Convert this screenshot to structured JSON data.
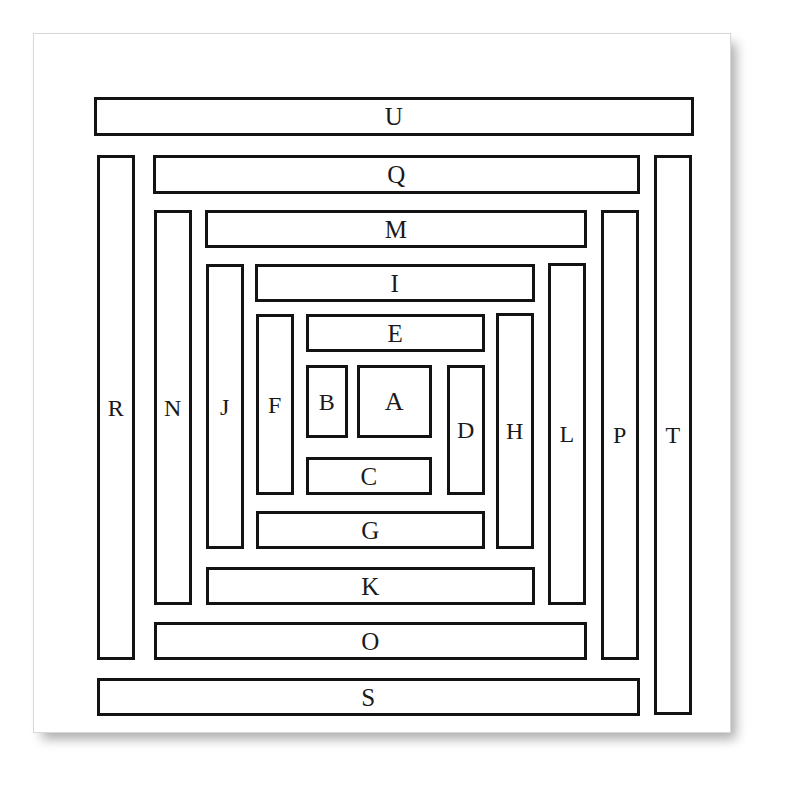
{
  "figure": {
    "background_color": "#ffffff",
    "paper_color": "#ffffff",
    "stroke_color": "#131313",
    "label_color": "#1a1a1a",
    "stroke_width_px": 3,
    "paper": {
      "x": 33,
      "y": 33,
      "w": 698,
      "h": 700
    },
    "labels_in_spiral_order": [
      "A",
      "B",
      "C",
      "D",
      "E",
      "F",
      "G",
      "H",
      "I",
      "J",
      "K",
      "L",
      "M",
      "N",
      "O",
      "P",
      "Q",
      "R",
      "S",
      "T",
      "U"
    ],
    "rect_count": 21
  },
  "chart_data": {
    "type": "table",
    "xlabel": "",
    "ylabel": "",
    "columns": [
      "label",
      "x",
      "y",
      "w",
      "h",
      "orientation"
    ],
    "rects": [
      {
        "label": "A",
        "x": 357,
        "y": 365,
        "w": 75,
        "h": 73,
        "orientation": "square"
      },
      {
        "label": "B",
        "x": 306,
        "y": 365,
        "w": 42,
        "h": 73,
        "orientation": "vertical"
      },
      {
        "label": "C",
        "x": 306,
        "y": 457,
        "w": 126,
        "h": 38,
        "orientation": "horizontal"
      },
      {
        "label": "D",
        "x": 447,
        "y": 365,
        "w": 38,
        "h": 130,
        "orientation": "vertical"
      },
      {
        "label": "E",
        "x": 306,
        "y": 314,
        "w": 179,
        "h": 38,
        "orientation": "horizontal"
      },
      {
        "label": "F",
        "x": 256,
        "y": 314,
        "w": 38,
        "h": 181,
        "orientation": "vertical"
      },
      {
        "label": "G",
        "x": 256,
        "y": 511,
        "w": 229,
        "h": 38,
        "orientation": "horizontal"
      },
      {
        "label": "H",
        "x": 496,
        "y": 313,
        "w": 38,
        "h": 236,
        "orientation": "vertical"
      },
      {
        "label": "I",
        "x": 255,
        "y": 264,
        "w": 280,
        "h": 38,
        "orientation": "horizontal"
      },
      {
        "label": "J",
        "x": 206,
        "y": 264,
        "w": 38,
        "h": 285,
        "orientation": "vertical"
      },
      {
        "label": "K",
        "x": 206,
        "y": 567,
        "w": 329,
        "h": 38,
        "orientation": "horizontal"
      },
      {
        "label": "L",
        "x": 548,
        "y": 263,
        "w": 38,
        "h": 342,
        "orientation": "vertical"
      },
      {
        "label": "M",
        "x": 205,
        "y": 210,
        "w": 382,
        "h": 38,
        "orientation": "horizontal"
      },
      {
        "label": "N",
        "x": 154,
        "y": 210,
        "w": 38,
        "h": 395,
        "orientation": "vertical"
      },
      {
        "label": "O",
        "x": 154,
        "y": 622,
        "w": 433,
        "h": 38,
        "orientation": "horizontal"
      },
      {
        "label": "P",
        "x": 601,
        "y": 210,
        "w": 38,
        "h": 450,
        "orientation": "vertical"
      },
      {
        "label": "Q",
        "x": 153,
        "y": 155,
        "w": 487,
        "h": 39,
        "orientation": "horizontal"
      },
      {
        "label": "R",
        "x": 97,
        "y": 155,
        "w": 38,
        "h": 505,
        "orientation": "vertical"
      },
      {
        "label": "S",
        "x": 97,
        "y": 678,
        "w": 543,
        "h": 38,
        "orientation": "horizontal"
      },
      {
        "label": "T",
        "x": 654,
        "y": 155,
        "w": 38,
        "h": 560,
        "orientation": "vertical"
      },
      {
        "label": "U",
        "x": 94,
        "y": 97,
        "w": 600,
        "h": 39,
        "orientation": "horizontal"
      }
    ]
  }
}
